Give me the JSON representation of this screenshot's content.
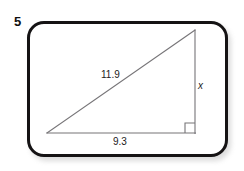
{
  "problem": {
    "number": "5"
  },
  "figure": {
    "type": "right-triangle",
    "labels": {
      "hypotenuse": "11.9",
      "base": "9.3",
      "height": "x"
    },
    "right_angle_vertex": "bottom-right",
    "colors": {
      "card_border": "#151314",
      "line": "#767477",
      "text": "#1d1b1c",
      "background": "#ffffff"
    }
  },
  "geometry": {
    "left_vertex": [
      47,
      133
    ],
    "right_vertex": [
      195,
      133
    ],
    "apex": [
      195,
      30
    ],
    "right_angle_marker": [
      185,
      123,
      10,
      10
    ]
  }
}
